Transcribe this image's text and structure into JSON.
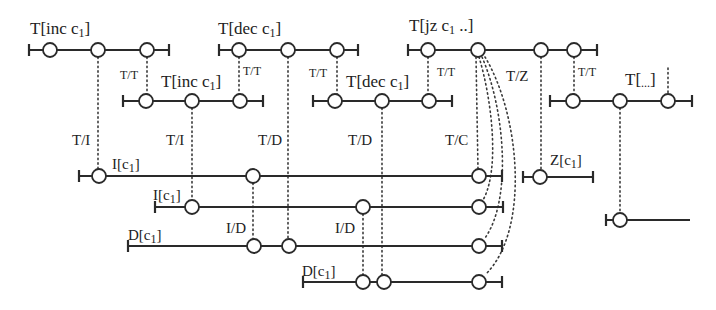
{
  "diagram": {
    "colors": {
      "line": "#2a2a2a",
      "node_fill": "#ffffff",
      "background": "#ffffff"
    },
    "timelines": [
      {
        "id": "t-inc-1",
        "label": "T[inc c1]",
        "label_main": "T[inc c",
        "label_sub": "1",
        "label_end": "]"
      },
      {
        "id": "t-dec-1",
        "label": "T[dec c1]",
        "label_main": "T[dec c",
        "label_sub": "1",
        "label_end": "]"
      },
      {
        "id": "t-jz-1",
        "label": "T[jz c1 ..]",
        "label_main": "T[jz c",
        "label_sub": "1",
        "label_end": " ..]"
      },
      {
        "id": "t-inc-2",
        "label": "T[inc c1]",
        "label_main": "T[inc c",
        "label_sub": "1",
        "label_end": "]"
      },
      {
        "id": "t-dec-2",
        "label": "T[dec c1]",
        "label_main": "T[dec c",
        "label_sub": "1",
        "label_end": "]"
      },
      {
        "id": "t-etc",
        "label": "T[...]",
        "label_main": "T[",
        "label_sub": "...",
        "label_end": "]"
      },
      {
        "id": "i-1",
        "label": "I[c1]",
        "label_main": "I[c",
        "label_sub": "1",
        "label_end": "]"
      },
      {
        "id": "z-1",
        "label": "Z[c1]",
        "label_main": "Z[c",
        "label_sub": "1",
        "label_end": "]"
      },
      {
        "id": "i-2",
        "label": "I[c1]",
        "label_main": "I[c",
        "label_sub": "1",
        "label_end": "]"
      },
      {
        "id": "d-1",
        "label": "D[c1]",
        "label_main": "D[c",
        "label_sub": "1",
        "label_end": "]"
      },
      {
        "id": "d-2",
        "label": "D[c1]",
        "label_main": "D[c",
        "label_sub": "1",
        "label_end": "]"
      },
      {
        "id": "unlabeled",
        "label": ""
      }
    ],
    "edge_labels": {
      "tt1": "T/T",
      "tt2": "T/T",
      "tt3": "T/T",
      "tt4": "T/T",
      "tt5": "T/T",
      "ti1": "T/I",
      "ti2": "T/I",
      "td1": "T/D",
      "td2": "T/D",
      "tc": "T/C",
      "tz": "T/Z",
      "id1": "I/D",
      "id2": "I/D"
    }
  }
}
